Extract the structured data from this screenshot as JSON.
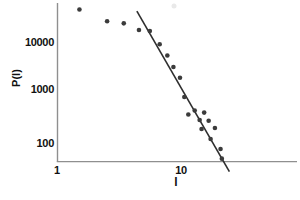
{
  "chart_data": {
    "type": "scatter",
    "title": "",
    "xlabel": "l",
    "ylabel": "P(l)",
    "x_scale": "log",
    "y_scale": "log",
    "xlim": [
      1,
      84
    ],
    "ylim": [
      43,
      59000
    ],
    "x_tick_labels": [
      "1",
      "10"
    ],
    "y_tick_labels": [
      "100",
      "1000",
      "10000"
    ],
    "grid": false,
    "legend": "none",
    "points": [
      [
        1.5,
        44000
      ],
      [
        2.5,
        25700
      ],
      [
        3.4,
        23400
      ],
      [
        4.5,
        17300
      ],
      [
        5.5,
        16500
      ],
      [
        6.6,
        9000
      ],
      [
        7.6,
        5400
      ],
      [
        8.5,
        3200
      ],
      [
        9.6,
        1960
      ],
      [
        10.4,
        815
      ],
      [
        11.2,
        366
      ],
      [
        12.6,
        440
      ],
      [
        13.8,
        285
      ],
      [
        14.3,
        189
      ],
      [
        15.0,
        400
      ],
      [
        16.3,
        275
      ],
      [
        16.9,
        120
      ],
      [
        18.3,
        198
      ],
      [
        20.3,
        76
      ],
      [
        20.8,
        49
      ]
    ],
    "fit_line": {
      "x1": 4.33,
      "y1": 41000,
      "x2": 23.9,
      "y2": 27
    },
    "colors": {
      "point": "#3b3b3b",
      "line": "#2e2e2e",
      "axis": "#8f8f8f",
      "faint_mark": "#e9e9e9",
      "text": "#111111"
    }
  }
}
